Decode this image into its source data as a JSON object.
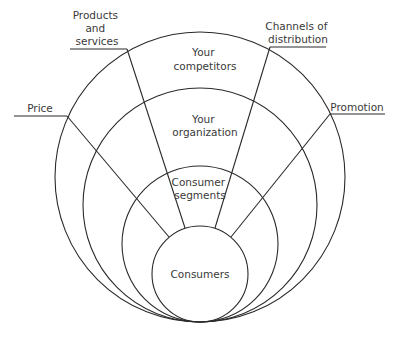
{
  "diagram": {
    "type": "concentric-market-environment",
    "rings": [
      {
        "id": "outer",
        "label_lines": [
          "Your",
          "competitors"
        ]
      },
      {
        "id": "organization",
        "label_lines": [
          "Your",
          "organization"
        ]
      },
      {
        "id": "segments",
        "label_lines": [
          "Consumer",
          "segments"
        ]
      },
      {
        "id": "core",
        "label_lines": [
          "Consumers"
        ]
      }
    ],
    "spokes": [
      {
        "id": "price",
        "label_lines": [
          "Price"
        ]
      },
      {
        "id": "products",
        "label_lines": [
          "Products",
          "and",
          "services"
        ]
      },
      {
        "id": "channels",
        "label_lines": [
          "Channels of",
          "distribution"
        ]
      },
      {
        "id": "promotion",
        "label_lines": [
          "Promotion"
        ]
      }
    ],
    "colors": {
      "line": "#2a2a2a",
      "text": "#3a3a3a",
      "background": "#ffffff"
    }
  }
}
